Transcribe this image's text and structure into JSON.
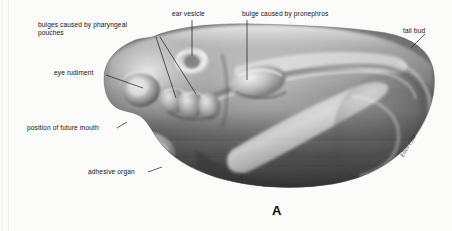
{
  "figure": {
    "letter": "A",
    "signature": "Ellen Cole",
    "background_color": "#fbfbfa",
    "ink_color": "#141414"
  },
  "labels": [
    {
      "id": "pharyngeal-pouches",
      "line1": "bulges caused by  pharyngeal",
      "line2": "pouches",
      "x": 38,
      "y": 21
    },
    {
      "id": "ear-vesicle",
      "text": "ear vesicle",
      "x": 172,
      "y": 10
    },
    {
      "id": "pronephros",
      "text": "bulge caused by pronephros",
      "x": 242,
      "y": 10
    },
    {
      "id": "tail-bud",
      "text": "tail bud",
      "x": 403,
      "y": 27
    },
    {
      "id": "eye-rudiment",
      "text": "eye rudiment",
      "x": 54,
      "y": 69
    },
    {
      "id": "future-mouth",
      "text": "position of future mouth",
      "x": 27,
      "y": 124
    },
    {
      "id": "adhesive-organ",
      "text": "adhesive organ",
      "x": 88,
      "y": 168
    }
  ],
  "specimen": {
    "name": "amphibian embryo lateral view",
    "features": [
      "eye rudiment",
      "pharyngeal pouches",
      "ear vesicle",
      "pronephros bulge",
      "tail bud",
      "position of future mouth",
      "adhesive organ"
    ]
  }
}
